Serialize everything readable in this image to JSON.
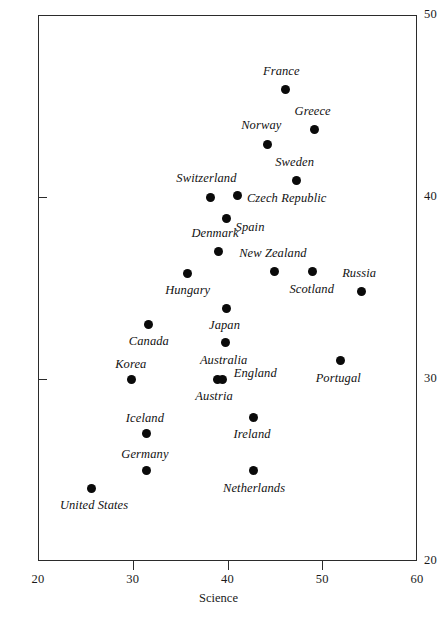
{
  "chart_data": {
    "type": "scatter",
    "title": "",
    "xlabel": "Science",
    "ylabel": "",
    "xlim": [
      20,
      60
    ],
    "ylim": [
      20,
      50
    ],
    "xticks": [
      20,
      30,
      40,
      50,
      60
    ],
    "yticks": [
      20,
      30,
      40,
      50
    ],
    "grid": false,
    "legend": "none",
    "point_color": "#0a0a0a",
    "axis_color": "#2b2b2b",
    "points": [
      {
        "label": "France",
        "x": 46.1,
        "y": 45.9,
        "label_dx": -4,
        "label_dy": -18,
        "anchor": "center"
      },
      {
        "label": "Greece",
        "x": 49.2,
        "y": 43.7,
        "label_dx": -2,
        "label_dy": -18,
        "anchor": "center"
      },
      {
        "label": "Norway",
        "x": 44.2,
        "y": 42.9,
        "label_dx": -6,
        "label_dy": -18,
        "anchor": "center"
      },
      {
        "label": "Sweden",
        "x": 47.3,
        "y": 40.9,
        "label_dx": -2,
        "label_dy": -18,
        "anchor": "center"
      },
      {
        "label": "Switzerland",
        "x": 38.2,
        "y": 40.0,
        "label_dx": -4,
        "label_dy": -18,
        "anchor": "center"
      },
      {
        "label": "Czech Republic",
        "x": 41.1,
        "y": 40.1,
        "label_dx": 9,
        "label_dy": 4,
        "anchor": "left"
      },
      {
        "label": "Spain",
        "x": 39.9,
        "y": 38.8,
        "label_dx": 9,
        "label_dy": 9,
        "anchor": "left"
      },
      {
        "label": "Denmark",
        "x": 39.0,
        "y": 37.0,
        "label_dx": -3,
        "label_dy": -18,
        "anchor": "center"
      },
      {
        "label": "New Zealand",
        "x": 45.0,
        "y": 35.9,
        "label_dx": -2,
        "label_dy": -18,
        "anchor": "center"
      },
      {
        "label": "Russia",
        "x": 54.1,
        "y": 34.8,
        "label_dx": -2,
        "label_dy": -18,
        "anchor": "center"
      },
      {
        "label": "Scotland",
        "x": 49.0,
        "y": 35.9,
        "label_dx": -1,
        "label_dy": 18,
        "anchor": "center"
      },
      {
        "label": "Hungary",
        "x": 35.8,
        "y": 35.8,
        "label_dx": 0,
        "label_dy": 18,
        "anchor": "center"
      },
      {
        "label": "Japan",
        "x": 39.9,
        "y": 33.9,
        "label_dx": -2,
        "label_dy": 18,
        "anchor": "center"
      },
      {
        "label": "Canada",
        "x": 31.7,
        "y": 33.0,
        "label_dx": 0,
        "label_dy": 18,
        "anchor": "center"
      },
      {
        "label": "Australia",
        "x": 39.8,
        "y": 32.0,
        "label_dx": -2,
        "label_dy": 18,
        "anchor": "center"
      },
      {
        "label": "Portugal",
        "x": 51.9,
        "y": 31.0,
        "label_dx": -2,
        "label_dy": 18,
        "anchor": "center"
      },
      {
        "label": "Korea",
        "x": 29.9,
        "y": 30.0,
        "label_dx": -1,
        "label_dy": -14,
        "anchor": "center"
      },
      {
        "label": "Austria",
        "x": 38.9,
        "y": 30.0,
        "label_dx": -3,
        "label_dy": 18,
        "anchor": "center"
      },
      {
        "label": "England",
        "x": 39.5,
        "y": 30.0,
        "label_dx": 11,
        "label_dy": -5,
        "anchor": "left"
      },
      {
        "label": "Ireland",
        "x": 42.7,
        "y": 27.9,
        "label_dx": -1,
        "label_dy": 18,
        "anchor": "center"
      },
      {
        "label": "Iceland",
        "x": 31.5,
        "y": 27.0,
        "label_dx": -2,
        "label_dy": -15,
        "anchor": "center"
      },
      {
        "label": "Germany",
        "x": 31.5,
        "y": 25.0,
        "label_dx": -2,
        "label_dy": -15,
        "anchor": "center"
      },
      {
        "label": "Netherlands",
        "x": 42.7,
        "y": 25.0,
        "label_dx": 1,
        "label_dy": 19,
        "anchor": "center"
      },
      {
        "label": "United States",
        "x": 25.6,
        "y": 24.0,
        "label_dx": 3,
        "label_dy": 18,
        "anchor": "center"
      }
    ]
  }
}
